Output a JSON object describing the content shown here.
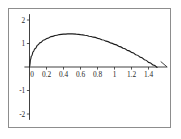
{
  "figure": {
    "background_color": "#ffffff",
    "frame_color": "#8d8d8d",
    "axis_color": "#2b2b2b",
    "curve_color": "#1b1b1b"
  },
  "chart_data": {
    "type": "line",
    "title": "",
    "subtitle": "",
    "xlabel": "",
    "ylabel": "",
    "xlim": [
      -0.06,
      1.62
    ],
    "ylim": [
      -2.25,
      2.25
    ],
    "grid": false,
    "legend": null,
    "annotations": [],
    "x_ticks": [
      0,
      0.2,
      0.4,
      0.6,
      0.8,
      1,
      1.2,
      1.4
    ],
    "x_tick_labels": [
      "0",
      "0.2",
      "0.4",
      "0.6",
      "0.8",
      "1",
      "1.2",
      "1.4"
    ],
    "y_ticks": [
      2,
      1,
      -1,
      -2
    ],
    "y_tick_labels": [
      "2",
      "1",
      "-1",
      "-2"
    ],
    "series": [
      {
        "name": "curve",
        "x": [
          0,
          0.01,
          0.02,
          0.04,
          0.06,
          0.09,
          0.12,
          0.16,
          0.2,
          0.25,
          0.3,
          0.35,
          0.4,
          0.45,
          0.5,
          0.55,
          0.6,
          0.65,
          0.7,
          0.75,
          0.8,
          0.85,
          0.9,
          0.95,
          1.0,
          1.05,
          1.1,
          1.15,
          1.2,
          1.25,
          1.3,
          1.35,
          1.4,
          1.45,
          1.5
        ],
        "y": [
          0,
          0.3,
          0.45,
          0.64,
          0.77,
          0.92,
          1.03,
          1.14,
          1.21,
          1.29,
          1.34,
          1.38,
          1.4,
          1.41,
          1.41,
          1.4,
          1.38,
          1.35,
          1.31,
          1.27,
          1.22,
          1.16,
          1.1,
          1.03,
          0.96,
          0.88,
          0.8,
          0.71,
          0.62,
          0.52,
          0.42,
          0.31,
          0.2,
          0.09,
          -0.02
        ]
      }
    ]
  }
}
